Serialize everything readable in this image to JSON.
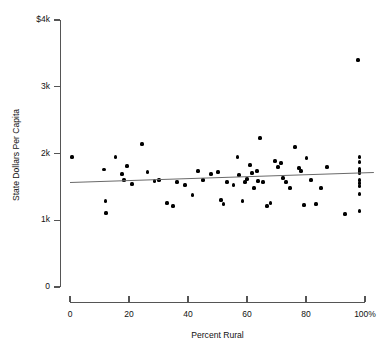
{
  "chart_data": {
    "type": "scatter",
    "title": "",
    "xlabel": "Percent Rural",
    "ylabel": "State Dollars Per Capita",
    "xlim": [
      0,
      100
    ],
    "ylim": [
      0,
      4000
    ],
    "grid": false,
    "legend": null,
    "x_ticks": [
      0,
      20,
      40,
      60,
      80,
      100
    ],
    "x_tick_labels": [
      "0",
      "20",
      "40",
      "60",
      "80",
      "100%"
    ],
    "y_ticks": [
      0,
      1000,
      2000,
      3000,
      4000
    ],
    "y_tick_labels": [
      "0",
      "1k",
      "2k",
      "3k",
      "$4k"
    ],
    "point_color": "#000000",
    "trend_color": "#6a6a6a",
    "trendline": {
      "x_start": 0,
      "y_start": 1573,
      "x_end": 103,
      "y_end": 1723
    },
    "points": [
      {
        "x": 0.7,
        "y": 1948
      },
      {
        "x": 11.5,
        "y": 1760
      },
      {
        "x": 11.9,
        "y": 1288
      },
      {
        "x": 12.2,
        "y": 1108
      },
      {
        "x": 15.3,
        "y": 1948
      },
      {
        "x": 17.6,
        "y": 1693
      },
      {
        "x": 18.3,
        "y": 1603
      },
      {
        "x": 19.3,
        "y": 1813
      },
      {
        "x": 21.0,
        "y": 1543
      },
      {
        "x": 24.4,
        "y": 2143
      },
      {
        "x": 26.4,
        "y": 1723
      },
      {
        "x": 28.7,
        "y": 1588
      },
      {
        "x": 30.2,
        "y": 1603
      },
      {
        "x": 32.9,
        "y": 1258
      },
      {
        "x": 34.9,
        "y": 1213
      },
      {
        "x": 36.3,
        "y": 1573
      },
      {
        "x": 39.0,
        "y": 1528
      },
      {
        "x": 41.4,
        "y": 1378
      },
      {
        "x": 43.4,
        "y": 1738
      },
      {
        "x": 45.1,
        "y": 1603
      },
      {
        "x": 47.8,
        "y": 1693
      },
      {
        "x": 50.2,
        "y": 1723
      },
      {
        "x": 51.2,
        "y": 1303
      },
      {
        "x": 51.9,
        "y": 1243
      },
      {
        "x": 53.2,
        "y": 1573
      },
      {
        "x": 55.3,
        "y": 1528
      },
      {
        "x": 56.9,
        "y": 1948
      },
      {
        "x": 57.3,
        "y": 1678
      },
      {
        "x": 58.6,
        "y": 1288
      },
      {
        "x": 59.3,
        "y": 1573
      },
      {
        "x": 60.0,
        "y": 1618
      },
      {
        "x": 61.0,
        "y": 1828
      },
      {
        "x": 61.7,
        "y": 1708
      },
      {
        "x": 62.4,
        "y": 1483
      },
      {
        "x": 63.4,
        "y": 1738
      },
      {
        "x": 63.7,
        "y": 1588
      },
      {
        "x": 64.4,
        "y": 2233
      },
      {
        "x": 65.4,
        "y": 1573
      },
      {
        "x": 66.8,
        "y": 1213
      },
      {
        "x": 68.1,
        "y": 1258
      },
      {
        "x": 69.5,
        "y": 1888
      },
      {
        "x": 70.5,
        "y": 1798
      },
      {
        "x": 71.5,
        "y": 1858
      },
      {
        "x": 72.2,
        "y": 1633
      },
      {
        "x": 73.2,
        "y": 1573
      },
      {
        "x": 74.6,
        "y": 1483
      },
      {
        "x": 76.3,
        "y": 2098
      },
      {
        "x": 77.6,
        "y": 1783
      },
      {
        "x": 78.3,
        "y": 1738
      },
      {
        "x": 79.3,
        "y": 1228
      },
      {
        "x": 80.3,
        "y": 1933
      },
      {
        "x": 81.7,
        "y": 1603
      },
      {
        "x": 83.4,
        "y": 1243
      },
      {
        "x": 85.1,
        "y": 1483
      },
      {
        "x": 87.1,
        "y": 1798
      },
      {
        "x": 93.2,
        "y": 1093
      },
      {
        "x": 97.6,
        "y": 3400
      },
      {
        "x": 98.0,
        "y": 1948
      },
      {
        "x": 98.0,
        "y": 1873
      },
      {
        "x": 98.0,
        "y": 1768
      },
      {
        "x": 98.0,
        "y": 1738
      },
      {
        "x": 98.0,
        "y": 1708
      },
      {
        "x": 98.0,
        "y": 1603
      },
      {
        "x": 98.0,
        "y": 1558
      },
      {
        "x": 98.0,
        "y": 1513
      },
      {
        "x": 98.0,
        "y": 1393
      },
      {
        "x": 98.0,
        "y": 1138
      }
    ]
  }
}
